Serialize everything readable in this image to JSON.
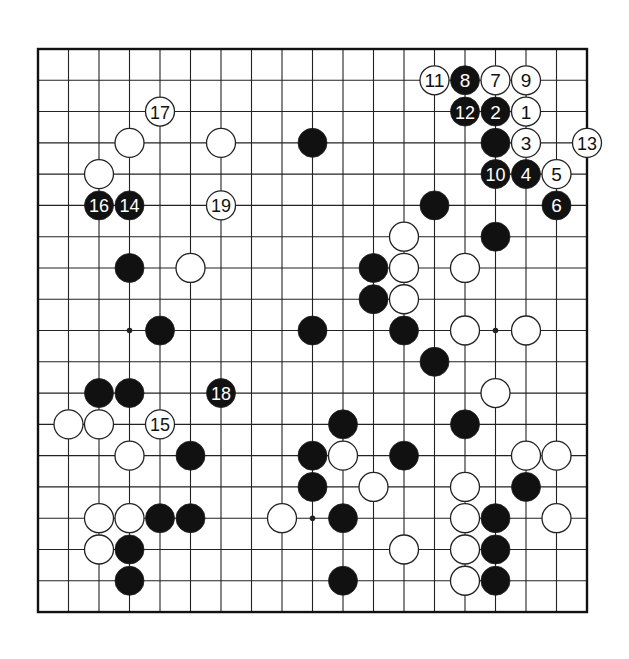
{
  "board": {
    "size": 19,
    "origin_x": 38,
    "origin_y": 49,
    "step_x": 30.5,
    "step_y": 31.28,
    "stone_radius": 14.5,
    "line_color": "#222222",
    "border_color": "#111111",
    "black_color": "#111111",
    "white_color": "#ffffff",
    "hoshi_visible": [
      [
        3,
        9
      ],
      [
        15,
        9
      ],
      [
        9,
        15
      ]
    ]
  },
  "stones": {
    "black": [
      [
        9,
        3
      ],
      [
        15,
        3
      ],
      [
        13,
        5
      ],
      [
        15,
        6
      ],
      [
        3,
        7
      ],
      [
        11,
        7
      ],
      [
        11,
        8
      ],
      [
        4,
        9
      ],
      [
        9,
        9
      ],
      [
        12,
        9
      ],
      [
        13,
        10
      ],
      [
        2,
        11
      ],
      [
        3,
        11
      ],
      [
        10,
        12
      ],
      [
        14,
        12
      ],
      [
        5,
        13
      ],
      [
        9,
        13
      ],
      [
        12,
        13
      ],
      [
        9,
        14
      ],
      [
        16,
        14
      ],
      [
        4,
        15
      ],
      [
        5,
        15
      ],
      [
        10,
        15
      ],
      [
        15,
        15
      ],
      [
        3,
        16
      ],
      [
        15,
        16
      ],
      [
        3,
        17
      ],
      [
        10,
        17
      ],
      [
        15,
        17
      ]
    ],
    "white": [
      [
        3,
        3
      ],
      [
        6,
        3
      ],
      [
        2,
        4
      ],
      [
        12,
        6
      ],
      [
        5,
        7
      ],
      [
        12,
        7
      ],
      [
        14,
        7
      ],
      [
        12,
        8
      ],
      [
        14,
        9
      ],
      [
        16,
        9
      ],
      [
        15,
        11
      ],
      [
        1,
        12
      ],
      [
        2,
        12
      ],
      [
        3,
        13
      ],
      [
        10,
        13
      ],
      [
        16,
        13
      ],
      [
        17,
        13
      ],
      [
        11,
        14
      ],
      [
        14,
        14
      ],
      [
        2,
        15
      ],
      [
        3,
        15
      ],
      [
        8,
        15
      ],
      [
        14,
        15
      ],
      [
        17,
        15
      ],
      [
        2,
        16
      ],
      [
        12,
        16
      ],
      [
        14,
        16
      ],
      [
        14,
        17
      ]
    ],
    "numbered": [
      {
        "n": "1",
        "color": "white",
        "c": 16,
        "r": 2
      },
      {
        "n": "2",
        "color": "black",
        "c": 15,
        "r": 2
      },
      {
        "n": "3",
        "color": "white",
        "c": 16,
        "r": 3
      },
      {
        "n": "4",
        "color": "black",
        "c": 16,
        "r": 4
      },
      {
        "n": "5",
        "color": "white",
        "c": 17,
        "r": 4
      },
      {
        "n": "6",
        "color": "black",
        "c": 17,
        "r": 5
      },
      {
        "n": "7",
        "color": "white",
        "c": 15,
        "r": 1
      },
      {
        "n": "8",
        "color": "black",
        "c": 14,
        "r": 1
      },
      {
        "n": "9",
        "color": "white",
        "c": 16,
        "r": 1
      },
      {
        "n": "10",
        "color": "black",
        "c": 15,
        "r": 4
      },
      {
        "n": "11",
        "color": "white",
        "c": 13,
        "r": 1
      },
      {
        "n": "12",
        "color": "black",
        "c": 14,
        "r": 2
      },
      {
        "n": "13",
        "color": "white",
        "c": 18,
        "r": 3
      },
      {
        "n": "14",
        "color": "black",
        "c": 3,
        "r": 5
      },
      {
        "n": "15",
        "color": "white",
        "c": 4,
        "r": 12
      },
      {
        "n": "16",
        "color": "black",
        "c": 2,
        "r": 5
      },
      {
        "n": "17",
        "color": "white",
        "c": 4,
        "r": 2
      },
      {
        "n": "18",
        "color": "black",
        "c": 6,
        "r": 11
      },
      {
        "n": "19",
        "color": "white",
        "c": 6,
        "r": 5
      }
    ]
  }
}
